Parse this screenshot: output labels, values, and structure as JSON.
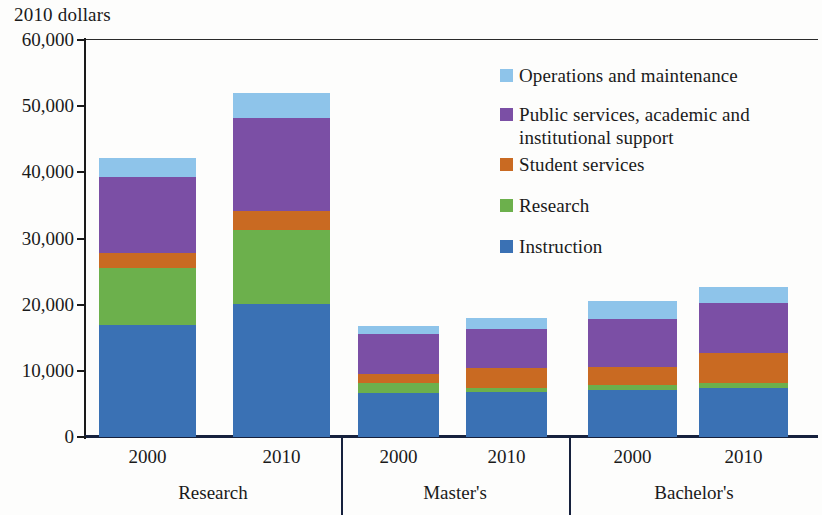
{
  "axis_unit_label": "2010 dollars",
  "legend": [
    {
      "label": "Operations and maintenance",
      "color": "#8ec4ea",
      "key": "operations"
    },
    {
      "label": "Public services, academic and institutional support",
      "color": "#7b4fa5",
      "key": "public_support"
    },
    {
      "label": "Student services",
      "color": "#c96a22",
      "key": "student_services"
    },
    {
      "label": "Research",
      "color": "#6cb04c",
      "key": "research"
    },
    {
      "label": "Instruction",
      "color": "#3a71b4",
      "key": "instruction"
    }
  ],
  "y_axis": {
    "ticks": [
      "0",
      "10,000",
      "20,000",
      "30,000",
      "40,000",
      "50,000",
      "60,000"
    ],
    "values": [
      0,
      10000,
      20000,
      30000,
      40000,
      50000,
      60000
    ],
    "min": 0,
    "max": 60000
  },
  "groups": [
    {
      "name": "Research",
      "years": [
        "2000",
        "2010"
      ]
    },
    {
      "name": "Master's",
      "years": [
        "2000",
        "2010"
      ]
    },
    {
      "name": "Bachelor's",
      "years": [
        "2000",
        "2010"
      ]
    }
  ],
  "chart_data": {
    "type": "bar",
    "stacked": true,
    "title": "",
    "subtitle": "",
    "xlabel": "",
    "ylabel": "2010 dollars",
    "ylim": [
      0,
      60000
    ],
    "ytick_values": [
      0,
      10000,
      20000,
      30000,
      40000,
      50000,
      60000
    ],
    "ytick_labels": [
      "0",
      "10,000",
      "20,000",
      "30,000",
      "40,000",
      "50,000",
      "60,000"
    ],
    "grid": false,
    "legend_position": "inside-top-right",
    "categories": [
      "Research 2000",
      "Research 2010",
      "Master's 2000",
      "Master's 2010",
      "Bachelor's 2000",
      "Bachelor's 2010"
    ],
    "group_labels": [
      "Research",
      "Master's",
      "Bachelor's"
    ],
    "year_labels": [
      "2000",
      "2010",
      "2000",
      "2010",
      "2000",
      "2010"
    ],
    "series": [
      {
        "name": "Instruction",
        "color": "#3a71b4",
        "values": [
          16900,
          20100,
          6600,
          6800,
          7100,
          7400
        ]
      },
      {
        "name": "Research",
        "color": "#6cb04c",
        "values": [
          8600,
          11200,
          1500,
          600,
          800,
          750
        ]
      },
      {
        "name": "Student services",
        "color": "#c96a22",
        "values": [
          2300,
          2900,
          1400,
          3000,
          2700,
          4500
        ]
      },
      {
        "name": "Public services, academic and institutional support",
        "color": "#7b4fa5",
        "values": [
          11500,
          14000,
          6000,
          5900,
          7300,
          7600
        ]
      },
      {
        "name": "Operations and maintenance",
        "color": "#8ec4ea",
        "values": [
          2900,
          3800,
          1300,
          1700,
          2700,
          2400
        ]
      }
    ],
    "totals": [
      42200,
      52000,
      16800,
      18000,
      20600,
      22650
    ]
  }
}
